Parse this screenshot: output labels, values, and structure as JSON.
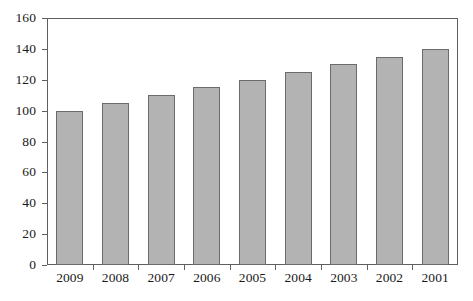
{
  "chart_data": {
    "type": "bar",
    "title": "",
    "subtitle": "",
    "xlabel": "",
    "ylabel": "",
    "categories": [
      "2009",
      "2008",
      "2007",
      "2006",
      "2005",
      "2004",
      "2003",
      "2002",
      "2001"
    ],
    "values": [
      100,
      105,
      110,
      115,
      120,
      125,
      130,
      135,
      140
    ],
    "ylim": [
      0,
      160
    ],
    "y_ticks": [
      0,
      20,
      40,
      60,
      80,
      100,
      120,
      140,
      160
    ],
    "y_tick_labels": [
      "0",
      "20",
      "40",
      "60",
      "80",
      "100",
      "120",
      "140",
      "160"
    ],
    "grid": false,
    "legend": null,
    "legend_position": "none",
    "series": [
      {
        "name": "",
        "values": [
          100,
          105,
          110,
          115,
          120,
          125,
          130,
          135,
          140
        ]
      }
    ],
    "annotations": [],
    "colors": {
      "bar_fill": "#b3b3b3",
      "bar_border": "#6b6b6b",
      "axis": "#5f5f5f",
      "background": "#ffffff",
      "text": "#1a1a1a"
    }
  }
}
